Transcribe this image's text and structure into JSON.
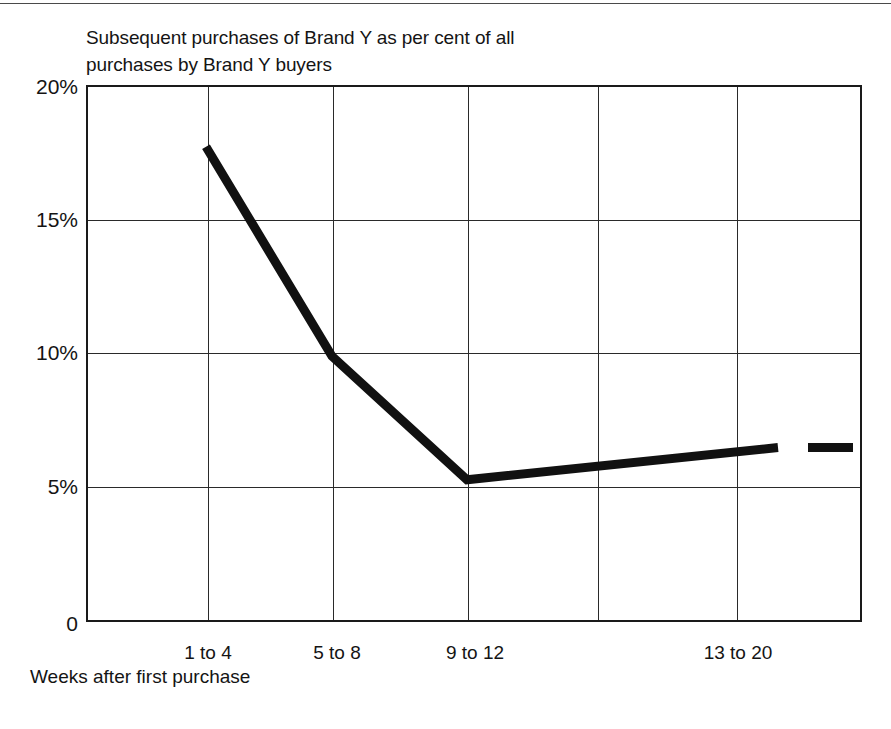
{
  "chart_data": {
    "type": "line",
    "title": "Subsequent purchases of Brand Y as per cent of all\npurchases by Brand Y buyers",
    "xlabel": "Weeks after first purchase",
    "ylabel": "",
    "categories": [
      "1 to 4",
      "5 to 8",
      "9 to 12",
      "13 to 20"
    ],
    "values": [
      17.7,
      9.9,
      5.3,
      6.5
    ],
    "series": [
      {
        "name": "Subsequent purchases of Brand Y",
        "values": [
          17.7,
          9.9,
          5.3,
          6.5
        ]
      }
    ],
    "ylim": [
      0,
      20
    ],
    "yticks": [
      0,
      5,
      10,
      15,
      20
    ],
    "ytick_labels": [
      "0",
      "5%",
      "10%",
      "15%",
      "20%"
    ],
    "xtick_labels": [
      "1 to 4",
      "5 to 8",
      "9 to 12",
      "13 to 20"
    ],
    "grid": true,
    "legend": "none",
    "line_color": "#111111",
    "line_width": 9,
    "annotations": [
      {
        "kind": "terminal-dash",
        "note": "short detached horizontal dash continuing the series to the right edge at about 6.5%",
        "value": 6.5
      }
    ]
  },
  "axis": {
    "y_ticks": [
      {
        "label": "20%",
        "value": 20
      },
      {
        "label": "15%",
        "value": 15
      },
      {
        "label": "10%",
        "value": 10
      },
      {
        "label": "5%",
        "value": 5
      },
      {
        "label": "0",
        "value": 0
      }
    ],
    "x_ticks": [
      {
        "label": "1 to 4"
      },
      {
        "label": "5 to 8"
      },
      {
        "label": "9 to 12"
      },
      {
        "label": "13 to 20"
      }
    ],
    "x_title": "Weeks after first purchase"
  },
  "colors": {
    "line": "#111111",
    "grid": "#2a2a2a",
    "frame": "#1a1a1a",
    "text": "#141414",
    "rule": "#4a4a4a",
    "background": "#ffffff"
  }
}
